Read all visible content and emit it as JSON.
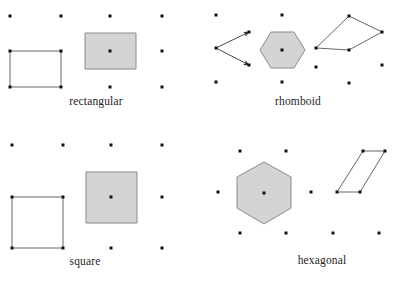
{
  "figure": {
    "background_color": "#ffffff",
    "dot_color": "#111111",
    "outline_color": "#555555",
    "fill_color": "#d4d4d4",
    "fill_stroke_color": "#8a8a8a",
    "text_color": "#1d1d1d"
  },
  "panels": [
    {
      "id": "rectangular",
      "label": "rectangular",
      "label_x": 96,
      "label_y": 105,
      "lattice": {
        "type": "rectangular",
        "a1": [
          51,
          0
        ],
        "a2": [
          0,
          35.5
        ],
        "dots": [
          [
            10,
            16
          ],
          [
            61,
            16
          ],
          [
            110,
            16
          ],
          [
            162,
            16
          ],
          [
            10,
            51
          ],
          [
            61,
            51
          ],
          [
            110,
            51
          ],
          [
            162,
            51
          ],
          [
            10,
            87
          ],
          [
            61,
            87
          ],
          [
            110,
            87
          ],
          [
            162,
            87
          ]
        ]
      },
      "unit_cell": {
        "name": "primitive-unit-cell",
        "points": [
          [
            10,
            51
          ],
          [
            61,
            51
          ],
          [
            61,
            87
          ],
          [
            10,
            87
          ]
        ],
        "filled": false
      },
      "wigner_seitz": {
        "name": "wigner-seitz-cell",
        "points": [
          [
            85,
            33
          ],
          [
            136,
            33
          ],
          [
            136,
            69
          ],
          [
            85,
            69
          ]
        ],
        "filled": true,
        "center": [
          110,
          51
        ]
      },
      "vectors": []
    },
    {
      "id": "rhomboid",
      "label": "rhomboid",
      "label_x": 298,
      "label_y": 105,
      "lattice": {
        "type": "rhomboid",
        "a1": [
          33,
          -16
        ],
        "a2": [
          33,
          17
        ],
        "dots": [
          [
            216,
            15
          ],
          [
            282,
            15
          ],
          [
            349,
            16
          ],
          [
            216,
            48
          ],
          [
            249,
            32
          ],
          [
            249,
            65
          ],
          [
            282,
            50
          ],
          [
            316,
            48
          ],
          [
            349,
            50
          ],
          [
            382,
            32
          ],
          [
            382,
            65
          ],
          [
            216,
            82
          ],
          [
            282,
            82
          ],
          [
            316,
            67
          ],
          [
            349,
            83
          ]
        ]
      },
      "unit_cell": {
        "name": "primitive-unit-cell",
        "points": [
          [
            316,
            48
          ],
          [
            349,
            16
          ],
          [
            382,
            32
          ],
          [
            349,
            50
          ]
        ],
        "filled": false
      },
      "wigner_seitz": {
        "name": "wigner-seitz-cell",
        "points": [
          [
            271,
            32
          ],
          [
            294,
            32
          ],
          [
            305,
            50
          ],
          [
            294,
            68
          ],
          [
            271,
            68
          ],
          [
            260,
            50
          ]
        ],
        "filled": true,
        "center": [
          282,
          50
        ]
      },
      "vectors": [
        {
          "name": "lattice-vector-a1",
          "from": [
            216,
            48
          ],
          "to": [
            249,
            32
          ]
        },
        {
          "name": "lattice-vector-a2",
          "from": [
            216,
            48
          ],
          "to": [
            249,
            65
          ]
        }
      ]
    },
    {
      "id": "square",
      "label": "square",
      "label_x": 85,
      "label_y": 265,
      "lattice": {
        "type": "square",
        "a1": [
          51,
          0
        ],
        "a2": [
          0,
          51
        ],
        "dots": [
          [
            12,
            145
          ],
          [
            63,
            145
          ],
          [
            111,
            145
          ],
          [
            162,
            145
          ],
          [
            12,
            197
          ],
          [
            63,
            197
          ],
          [
            111,
            197
          ],
          [
            162,
            197
          ],
          [
            12,
            248
          ],
          [
            63,
            248
          ],
          [
            111,
            248
          ],
          [
            162,
            248
          ]
        ]
      },
      "unit_cell": {
        "name": "primitive-unit-cell",
        "points": [
          [
            12,
            197
          ],
          [
            63,
            197
          ],
          [
            63,
            248
          ],
          [
            12,
            248
          ]
        ],
        "filled": false
      },
      "wigner_seitz": {
        "name": "wigner-seitz-cell",
        "points": [
          [
            86,
            172
          ],
          [
            137,
            172
          ],
          [
            137,
            223
          ],
          [
            86,
            223
          ]
        ],
        "filled": true,
        "center": [
          111,
          197
        ]
      },
      "vectors": []
    },
    {
      "id": "hexagonal",
      "label": "hexagonal",
      "label_x": 322,
      "label_y": 264,
      "lattice": {
        "type": "hexagonal",
        "a1": [
          46,
          0
        ],
        "a2": [
          23,
          -40
        ],
        "dots": [
          [
            240,
            151
          ],
          [
            286,
            151
          ],
          [
            363,
            151
          ],
          [
            385,
            151
          ],
          [
            218,
            192
          ],
          [
            264,
            193
          ],
          [
            311,
            192
          ],
          [
            337,
            192
          ],
          [
            360,
            192
          ],
          [
            240,
            233
          ],
          [
            286,
            233
          ],
          [
            333,
            233
          ],
          [
            379,
            233
          ]
        ]
      },
      "unit_cell": {
        "name": "primitive-unit-cell",
        "points": [
          [
            337,
            192
          ],
          [
            363,
            151
          ],
          [
            385,
            151
          ],
          [
            360,
            192
          ]
        ],
        "filled": false
      },
      "wigner_seitz": {
        "name": "wigner-seitz-cell",
        "points": [
          [
            264,
            162
          ],
          [
            291,
            177
          ],
          [
            291,
            208
          ],
          [
            264,
            224
          ],
          [
            237,
            208
          ],
          [
            237,
            177
          ]
        ],
        "filled": true,
        "center": [
          264,
          193
        ]
      },
      "vectors": []
    }
  ]
}
